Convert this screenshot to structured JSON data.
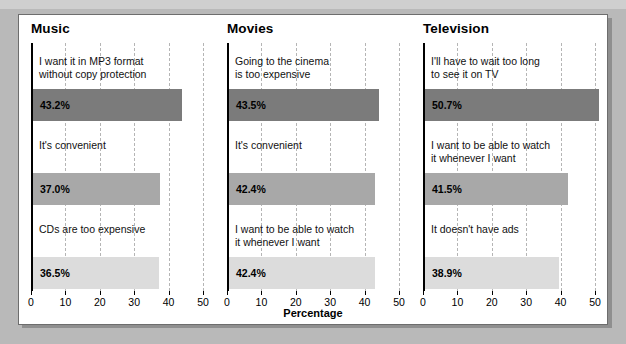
{
  "chart_data": {
    "type": "bar",
    "title": "",
    "xlabel": "Percentage",
    "ylabel": "",
    "xlim": [
      0,
      50
    ],
    "xticks": [
      0,
      10,
      20,
      30,
      40,
      50
    ],
    "grid": "vertical-dashed",
    "legend": "none",
    "orientation": "horizontal",
    "panels": [
      {
        "title": "Music",
        "bars": [
          {
            "label": "I want it in MP3 format\nwithout copy protection",
            "value": 43.2,
            "value_label": "43.2%",
            "shade": "dark"
          },
          {
            "label": "It's convenient",
            "value": 37.0,
            "value_label": "37.0%",
            "shade": "mid"
          },
          {
            "label": "CDs are too expensive",
            "value": 36.5,
            "value_label": "36.5%",
            "shade": "light"
          }
        ]
      },
      {
        "title": "Movies",
        "bars": [
          {
            "label": "Going to the cinema\nis too expensive",
            "value": 43.5,
            "value_label": "43.5%",
            "shade": "dark"
          },
          {
            "label": "It's convenient",
            "value": 42.4,
            "value_label": "42.4%",
            "shade": "mid"
          },
          {
            "label": "I want to be able to watch\nit whenever I want",
            "value": 42.4,
            "value_label": "42.4%",
            "shade": "light"
          }
        ]
      },
      {
        "title": "Television",
        "bars": [
          {
            "label": "I'll have to wait too long\nto see it on TV",
            "value": 50.7,
            "value_label": "50.7%",
            "shade": "dark"
          },
          {
            "label": "I want to be able to watch\nit whenever I want",
            "value": 41.5,
            "value_label": "41.5%",
            "shade": "mid"
          },
          {
            "label": "It doesn't have ads",
            "value": 38.9,
            "value_label": "38.9%",
            "shade": "light"
          }
        ]
      }
    ],
    "colors": {
      "dark": "#7b7b7b",
      "mid": "#a8a8a8",
      "light": "#dcdcdc",
      "axis": "#000000",
      "gridline": "#b5b5b5",
      "figure_background": "#ffffff",
      "page_background": "#b9b9b9"
    }
  }
}
